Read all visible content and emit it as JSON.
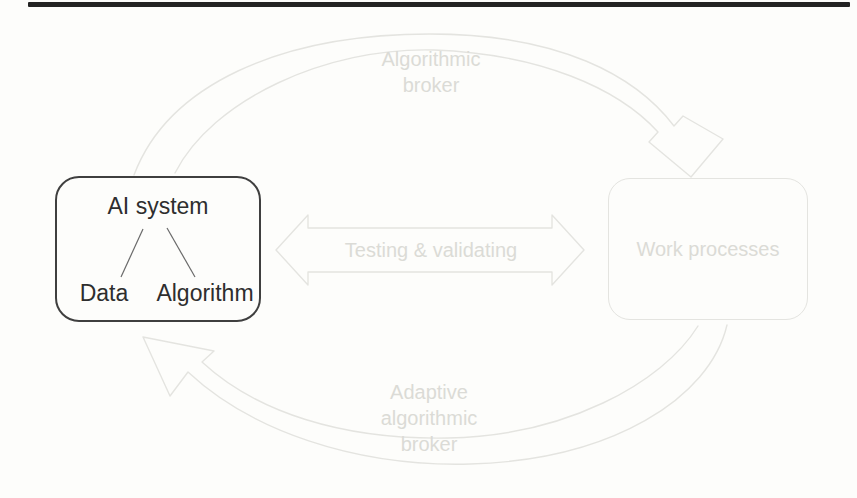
{
  "page": {
    "background_color": "#fdfdfb",
    "top_rule_color": "#232323"
  },
  "diagram": {
    "ink_text_color": "#2e2e2e",
    "box_border_color": "#3f3f3f",
    "faint_stroke_color": "#e4e4e0",
    "faint_text_color": "#dbdbd6",
    "ai_system_box": {
      "title": "AI system",
      "children": [
        {
          "label": "Data"
        },
        {
          "label": "Algorithm"
        }
      ]
    },
    "work_processes_box": {
      "label": "Work processes"
    },
    "middle_arrow": {
      "label": "Testing & validating",
      "direction": "bidirectional"
    },
    "top_arrow": {
      "label": "Algorithmic broker",
      "from": "AI system",
      "to": "Work processes"
    },
    "bottom_arrow": {
      "label": "Adaptive algorithmic broker",
      "from": "Work processes",
      "to": "AI system"
    }
  }
}
